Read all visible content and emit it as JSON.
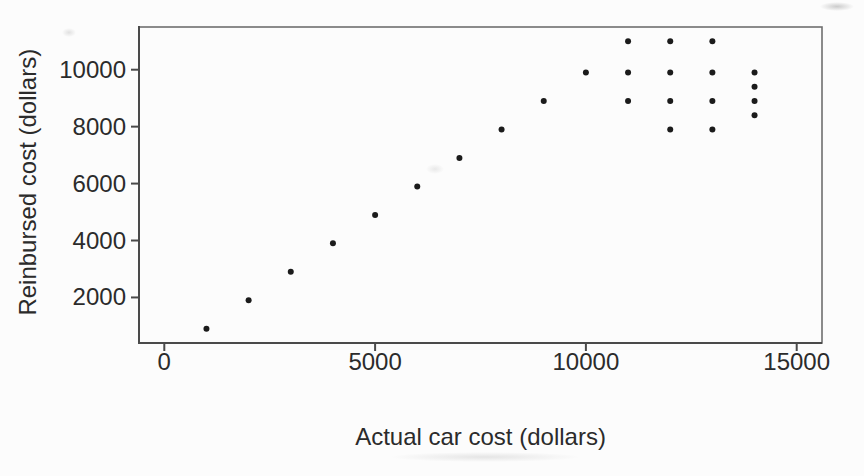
{
  "figure": {
    "background": "#fcfcfc",
    "text_color": "#2b2b2b",
    "axis_color": "#4a4a4a",
    "frame_color": "#6f6f6f",
    "point_color": "#1b1b1b"
  },
  "chart_data": {
    "type": "scatter",
    "title": "",
    "xlabel": "Actual car cost (dollars)",
    "ylabel": "Reinbursed cost (dollars)",
    "x_ticks": [
      0,
      5000,
      10000,
      15000
    ],
    "y_ticks": [
      2000,
      4000,
      6000,
      8000,
      10000
    ],
    "xlim": [
      -600,
      15600
    ],
    "ylim": [
      400,
      11500
    ],
    "grid": false,
    "legend_position": "none",
    "marker": "filled-circle",
    "marker_radius_px": 3,
    "points": [
      [
        1000,
        900
      ],
      [
        2000,
        1900
      ],
      [
        3000,
        2900
      ],
      [
        4000,
        3900
      ],
      [
        5000,
        4900
      ],
      [
        6000,
        5900
      ],
      [
        7000,
        6900
      ],
      [
        8000,
        7900
      ],
      [
        9000,
        8900
      ],
      [
        10000,
        9900
      ],
      [
        11000,
        8900
      ],
      [
        11000,
        9900
      ],
      [
        11000,
        11000
      ],
      [
        12000,
        7900
      ],
      [
        12000,
        8900
      ],
      [
        12000,
        9900
      ],
      [
        12000,
        11000
      ],
      [
        13000,
        7900
      ],
      [
        13000,
        8900
      ],
      [
        13000,
        9900
      ],
      [
        13000,
        11000
      ],
      [
        14000,
        8400
      ],
      [
        14000,
        8900
      ],
      [
        14000,
        9400
      ],
      [
        14000,
        9900
      ]
    ]
  }
}
